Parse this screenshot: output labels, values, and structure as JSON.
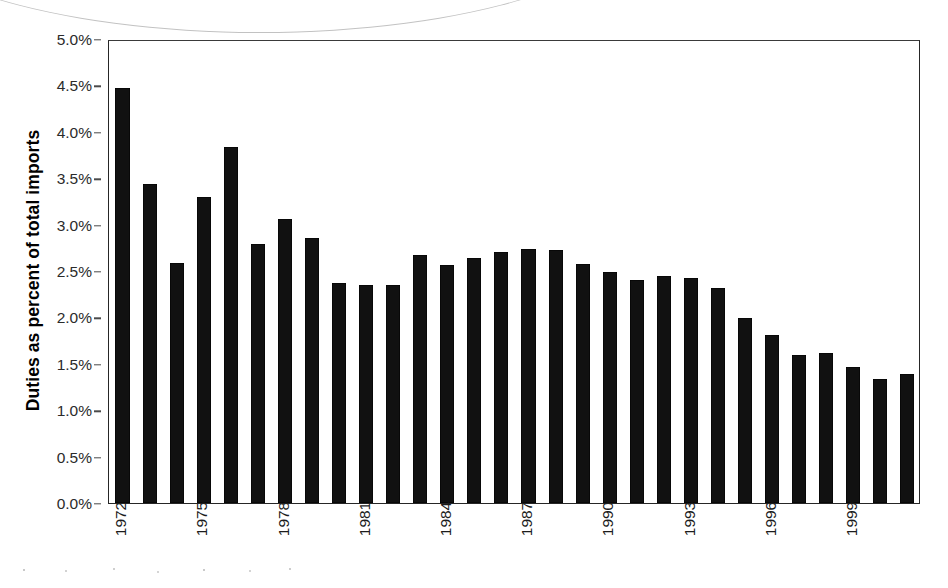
{
  "chart_data": {
    "type": "bar",
    "title": "",
    "subtitle": "",
    "xlabel": "",
    "ylabel": "Duties as percent of total imports",
    "ylim": [
      0,
      5
    ],
    "ytick_labels": [
      "0.0%",
      "0.5%",
      "1.0%",
      "1.5%",
      "2.0%",
      "2.5%",
      "3.0%",
      "3.5%",
      "4.0%",
      "4.5%",
      "5.0%"
    ],
    "ytick_values": [
      0,
      0.5,
      1.0,
      1.5,
      2.0,
      2.5,
      3.0,
      3.5,
      4.0,
      4.5,
      5.0
    ],
    "ytick_format": "percent",
    "xtick_labels": [
      "1972",
      "1975",
      "1978",
      "1981",
      "1984",
      "1987",
      "1990",
      "1993",
      "1996",
      "1999"
    ],
    "xtick_label_rotation": -90,
    "xtick_every": 3,
    "grid": false,
    "legend": false,
    "legend_position": "none",
    "bar_color": "#111111",
    "categories": [
      "1972",
      "1973",
      "1974",
      "1975",
      "1976",
      "1977",
      "1978",
      "1979",
      "1980",
      "1981",
      "1982",
      "1983",
      "1984",
      "1985",
      "1986",
      "1987",
      "1988",
      "1989",
      "1990",
      "1991",
      "1992",
      "1993",
      "1994",
      "1995",
      "1996",
      "1997",
      "1998",
      "1999",
      "2000",
      "2001"
    ],
    "values": [
      4.47,
      3.44,
      2.59,
      3.3,
      3.84,
      2.79,
      3.06,
      2.86,
      2.37,
      2.35,
      2.35,
      2.67,
      2.56,
      2.64,
      2.71,
      2.74,
      2.73,
      2.58,
      2.49,
      2.4,
      2.45,
      2.43,
      2.32,
      1.99,
      1.81,
      1.59,
      1.62,
      1.47,
      1.34,
      1.39
    ],
    "units": "percent"
  },
  "axes": {
    "y_title": "Duties as percent of total imports"
  },
  "artifacts": {
    "scan_arc": "faint curved scanner line across top-left",
    "scan_speckle": "faint speckle along bottom edge"
  }
}
